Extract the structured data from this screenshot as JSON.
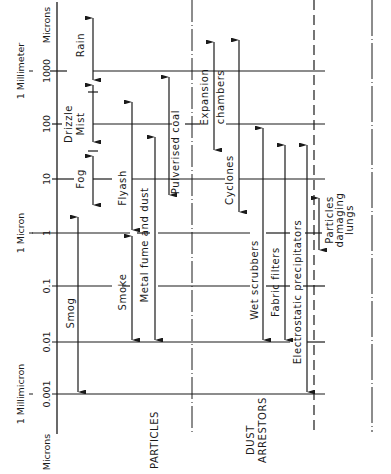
{
  "axis": {
    "units_top": "Microns",
    "units_bottom": "Microns",
    "ticks": [
      {
        "label": "1000",
        "y": 71,
        "long_label": "1 Millimeter"
      },
      {
        "label": "100",
        "y": 124,
        "long_label": ""
      },
      {
        "label": "10",
        "y": 179,
        "long_label": ""
      },
      {
        "label": "1",
        "y": 233,
        "long_label": "1 Micron"
      },
      {
        "label": "0.1",
        "y": 286,
        "long_label": ""
      },
      {
        "label": "0.01",
        "y": 342,
        "long_label": ""
      },
      {
        "label": "0.001",
        "y": 394,
        "long_label": "1 Millimicron"
      }
    ]
  },
  "sections": {
    "particles": "PARTICLES",
    "dust_arrestors_line1": "DUST",
    "dust_arrestors_line2": "ARRESTORS"
  },
  "particles": [
    {
      "label": "Rain",
      "x": 93,
      "from_um": 3000,
      "to_um": 400
    },
    {
      "label": "Drizzle",
      "x": 93,
      "from_um": 400,
      "to_um": 40
    },
    {
      "label": "Mist",
      "x": 93,
      "from_um": 400,
      "to_um": 40
    },
    {
      "label": "Fog",
      "x": 93,
      "from_um": 40,
      "to_um": 5
    },
    {
      "label": "Smog",
      "x": 78,
      "from_um": 2,
      "to_um": 0.001
    },
    {
      "label": "Flyash",
      "x": 132,
      "from_um": 300,
      "to_um": 1
    },
    {
      "label": "Smoke",
      "x": 132,
      "from_um": 1,
      "to_um": 0.01
    },
    {
      "label": "Metal fume and dust",
      "x": 155,
      "from_um": 60,
      "to_um": 0.01
    },
    {
      "label": "Pulverised coal",
      "x": 169,
      "from_um": 700,
      "to_um": 3
    }
  ],
  "dust_arrestors": [
    {
      "label": "Expansion chambers",
      "x": 214,
      "from_um": 2000,
      "to_um": 40
    },
    {
      "label": "Cyclones",
      "x": 239,
      "from_um": 2000,
      "to_um": 5
    },
    {
      "label": "Wet scrubbers",
      "x": 263,
      "from_um": 200,
      "to_um": 0.01
    },
    {
      "label": "Fabric filters",
      "x": 285,
      "from_um": 50,
      "to_um": 0.01
    },
    {
      "label": "Electrostatic precipitators",
      "x": 307,
      "from_um": 50,
      "to_um": 0.001
    },
    {
      "label": "Particles damaging lungs",
      "x": 319,
      "from_um": 5,
      "to_um": 0.5
    }
  ],
  "labels": {
    "rain": "Rain",
    "drizzle": "Drizzle",
    "mist": "Mist",
    "fog": "Fog",
    "smog": "Smog",
    "flyash": "Flyash",
    "smoke": "Smoke",
    "metal_fume": "Metal fume and dust",
    "pulverised_coal": "Pulverised coal",
    "expansion": "Expansion",
    "chambers": "chambers",
    "cyclones": "Cyclones",
    "wet_scrubbers": "Wet scrubbers",
    "fabric_filters": "Fabric filters",
    "electrostatic": "Electrostatic precipitators",
    "lungs_1": "Particles",
    "lungs_2": "damaging",
    "lungs_3": "lungs"
  },
  "colors": {
    "ink": "#1a1a1a",
    "background": "#ffffff"
  }
}
